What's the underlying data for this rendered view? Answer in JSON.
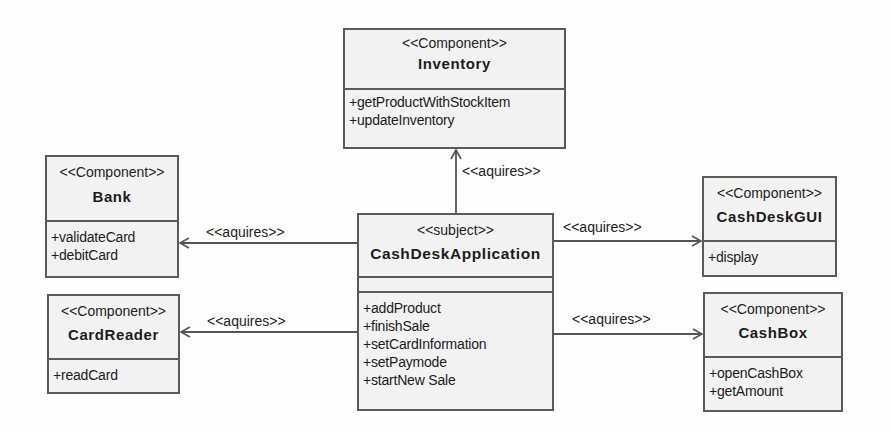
{
  "diagram": {
    "type": "UML component diagram",
    "subject": {
      "stereotype": "<<subject>>",
      "name": "CashDeskApplication",
      "operations": [
        "+addProduct",
        "+finishSale",
        "+setCardInformation",
        "+setPaymode",
        "+startNew Sale"
      ]
    },
    "components": [
      {
        "id": "inventory",
        "stereotype": "<<Component>>",
        "name": "Inventory",
        "operations": [
          "+getProductWithStockItem",
          "+updateInventory"
        ]
      },
      {
        "id": "bank",
        "stereotype": "<<Component>>",
        "name": "Bank",
        "operations": [
          "+validateCard",
          "+debitCard"
        ]
      },
      {
        "id": "cardreader",
        "stereotype": "<<Component>>",
        "name": "CardReader",
        "operations": [
          "+readCard"
        ]
      },
      {
        "id": "cashdeskgui",
        "stereotype": "<<Component>>",
        "name": "CashDeskGUI",
        "operations": [
          "+display"
        ]
      },
      {
        "id": "cashbox",
        "stereotype": "<<Component>>",
        "name": "CashBox",
        "operations": [
          "+openCashBox",
          "+getAmount"
        ]
      }
    ],
    "relations": [
      {
        "from": "CashDeskApplication",
        "to": "Inventory",
        "label": "<<aquires>>"
      },
      {
        "from": "CashDeskApplication",
        "to": "Bank",
        "label": "<<aquires>>"
      },
      {
        "from": "CashDeskApplication",
        "to": "CardReader",
        "label": "<<aquires>>"
      },
      {
        "from": "CashDeskApplication",
        "to": "CashDeskGUI",
        "label": "<<aquires>>"
      },
      {
        "from": "CashDeskApplication",
        "to": "CashBox",
        "label": "<<aquires>>"
      }
    ]
  },
  "colors": {
    "box_fill": "#f2f2f2",
    "border": "#5a5a5a",
    "text": "#1c1c1c"
  }
}
